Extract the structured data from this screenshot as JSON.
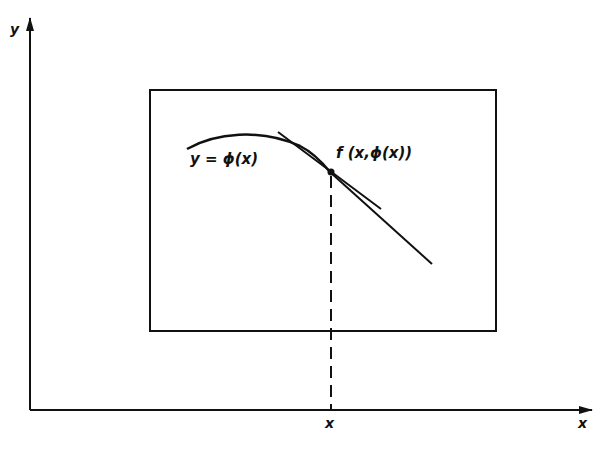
{
  "figure": {
    "axes": {
      "x_label": "x",
      "y_label": "y",
      "x_tick_label": "x"
    },
    "curve_label": "y = ϕ(x)",
    "point_label": "f (x,ϕ(x))",
    "colors": {
      "ink": "#111111",
      "background": "#ffffff"
    }
  }
}
